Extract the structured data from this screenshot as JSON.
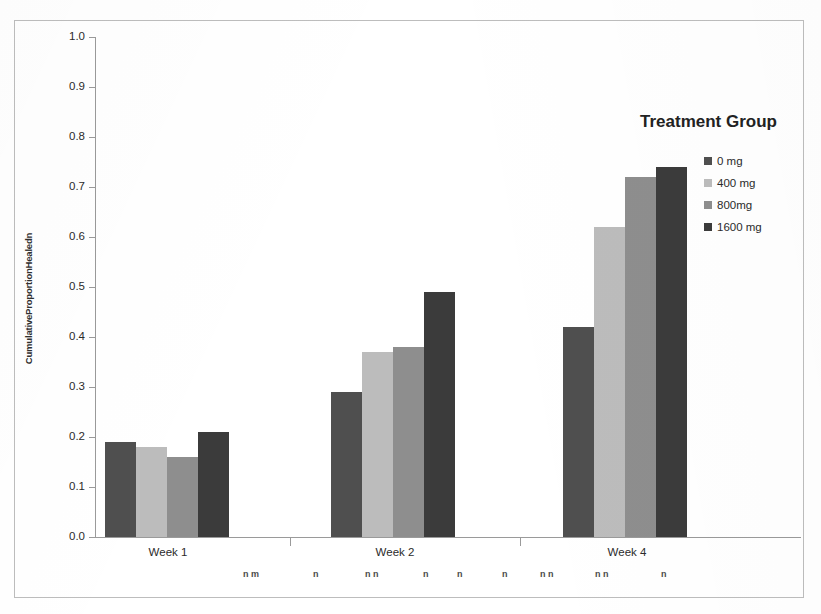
{
  "chart_data": {
    "type": "bar",
    "title": "",
    "xlabel": "",
    "ylabel": "CumulativeProportionHealedn",
    "categories": [
      "Week 1",
      "Week 2",
      "Week 4"
    ],
    "series": [
      {
        "name": "0 mg",
        "color": "#4f4f4f",
        "values": [
          0.19,
          0.29,
          0.42
        ]
      },
      {
        "name": "400 mg",
        "color": "#bcbcbc",
        "values": [
          0.18,
          0.37,
          0.62
        ]
      },
      {
        "name": "800mg",
        "color": "#8e8e8e",
        "values": [
          0.16,
          0.38,
          0.72
        ]
      },
      {
        "name": "1600 mg",
        "color": "#3b3b3b",
        "values": [
          0.21,
          0.49,
          0.74
        ]
      }
    ],
    "ylim": [
      0.0,
      1.0
    ],
    "ytick_labels": [
      "0.0",
      "0.1",
      "0.2",
      "0.3",
      "0.4",
      "0.5",
      "0.6",
      "0.7",
      "0.8",
      "0.9",
      "1.0"
    ],
    "ytick_values": [
      0.0,
      0.1,
      0.2,
      0.3,
      0.4,
      0.5,
      0.6,
      0.7,
      0.8,
      0.9,
      1.0
    ],
    "grid": false,
    "legend_position": "right"
  },
  "legend": {
    "title": "Treatment Group",
    "entries": [
      {
        "label": "0 mg",
        "color": "#4f4f4f"
      },
      {
        "label": "400 mg",
        "color": "#bcbcbc"
      },
      {
        "label": "800mg",
        "color": "#8e8e8e"
      },
      {
        "label": "1600 mg",
        "color": "#3b3b3b"
      }
    ]
  },
  "axis": {
    "y_title": "CumulativeProportionHealedn",
    "y_ticks": [
      "1.0",
      "0.9",
      "0.8",
      "0.7",
      "0.6",
      "0.5",
      "0.4",
      "0.3",
      "0.2",
      "0.1",
      "0.0"
    ],
    "x_groups": [
      "Week 1",
      "Week 2",
      "Week 4"
    ]
  },
  "artifacts": {
    "scan_marks": [
      {
        "text": "n m",
        "x": 243
      },
      {
        "text": "n",
        "x": 313
      },
      {
        "text": "n n",
        "x": 365
      },
      {
        "text": "n",
        "x": 423
      },
      {
        "text": "n",
        "x": 457
      },
      {
        "text": "n",
        "x": 502
      },
      {
        "text": "n n",
        "x": 540
      },
      {
        "text": "n n",
        "x": 595
      },
      {
        "text": "n",
        "x": 661
      }
    ]
  }
}
